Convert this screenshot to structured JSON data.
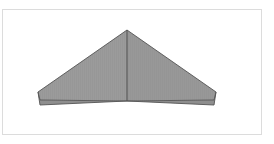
{
  "viewport": {
    "background_color": "#ffffff",
    "width": 274,
    "height": 144,
    "label": "3D model viewport"
  },
  "frame": {
    "name": "canvas-border",
    "x": 2,
    "y": 9,
    "width": 260,
    "height": 126,
    "border_color": "#dcdcdc",
    "border_width": 1,
    "fill_color": "#ffffff"
  },
  "model": {
    "name": "chevron-roof-solid",
    "description": "Symmetric gable / chevron roof form shown in perspective",
    "fill_color": "#9a9a9a",
    "fill_color_left": "#9b9b9b",
    "fill_color_right": "#989898",
    "underside_color": "#8e8e8e",
    "edge_color": "#555555",
    "ridge_color": "#4a4a4a",
    "edge_width": 0.9,
    "striation_color": "#8f8f8f",
    "striation_opacity": 0.35,
    "vertices": {
      "apex": [
        127,
        30
      ],
      "ridge_bottom": [
        127,
        101
      ],
      "left_tip_upper": [
        38,
        92
      ],
      "left_tip_lower": [
        40,
        105
      ],
      "left_eave_inner": [
        127,
        101
      ],
      "right_tip_upper": [
        216,
        92
      ],
      "right_tip_lower": [
        214,
        105
      ],
      "right_eave_inner": [
        127,
        101
      ]
    },
    "faces": [
      {
        "name": "left-roof-panel",
        "points": "127,30 38,92 40,100 127,101",
        "fill": "#9b9b9b"
      },
      {
        "name": "left-underside-sliver",
        "points": "38,92 40,105 127,101 40,100",
        "fill": "#8e8e8e"
      },
      {
        "name": "right-roof-panel",
        "points": "127,30 216,92 214,100 127,101",
        "fill": "#989898"
      },
      {
        "name": "right-underside-sliver",
        "points": "216,92 214,105 127,101 214,100",
        "fill": "#8e8e8e"
      }
    ]
  }
}
